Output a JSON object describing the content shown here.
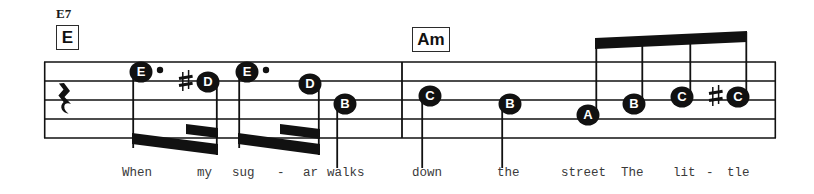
{
  "page": {
    "background": "#ffffff",
    "ink": "#111111",
    "width": 814,
    "height": 194
  },
  "chords": [
    {
      "name": "chord-e7",
      "text": "E7",
      "x": 56,
      "y": 8,
      "type": "symbol"
    },
    {
      "name": "chord-box-e",
      "text": "E",
      "x": 56,
      "y": 26,
      "w": 22,
      "h": 24,
      "type": "box"
    },
    {
      "name": "chord-box-am",
      "text": "Am",
      "x": 412,
      "y": 28,
      "w": 36,
      "h": 24,
      "type": "box"
    }
  ],
  "staff": {
    "left": 44,
    "right": 776,
    "top": 62,
    "line_gap": 19,
    "line_count": 5,
    "barlines": [
      402
    ],
    "rest": {
      "name": "quarter-rest",
      "x": 64,
      "y": 90,
      "label": "quarter-rest"
    }
  },
  "notes": [
    {
      "id": "n1",
      "letter": "E",
      "x": 141,
      "y": 72,
      "accidental": "",
      "dotted": true,
      "stem": "down",
      "lyric": "When"
    },
    {
      "id": "n2",
      "letter": "D",
      "x": 208,
      "y": 82,
      "accidental": "#",
      "dotted": false,
      "stem": "down",
      "lyric": ""
    },
    {
      "id": "n3",
      "letter": "E",
      "x": 247,
      "y": 72,
      "accidental": "",
      "dotted": true,
      "stem": "down",
      "lyric": "my"
    },
    {
      "id": "n4",
      "letter": "D",
      "x": 310,
      "y": 84,
      "accidental": "",
      "dotted": false,
      "stem": "down",
      "lyric": "sug"
    },
    {
      "id": "n5",
      "letter": "B",
      "x": 345,
      "y": 104,
      "accidental": "",
      "dotted": false,
      "stem": "down",
      "lyric": "ar"
    },
    {
      "id": "n6",
      "letter": "C",
      "x": 430,
      "y": 96,
      "accidental": "",
      "dotted": false,
      "stem": "down",
      "lyric": "down"
    },
    {
      "id": "n7",
      "letter": "B",
      "x": 510,
      "y": 104,
      "accidental": "",
      "dotted": false,
      "stem": "down",
      "lyric": "the"
    },
    {
      "id": "n8",
      "letter": "A",
      "x": 588,
      "y": 115,
      "accidental": "",
      "dotted": false,
      "stem": "up",
      "lyric": "street"
    },
    {
      "id": "n9",
      "letter": "B",
      "x": 634,
      "y": 104,
      "accidental": "",
      "dotted": false,
      "stem": "up",
      "lyric": "The"
    },
    {
      "id": "n10",
      "letter": "C",
      "x": 682,
      "y": 97,
      "accidental": "",
      "dotted": false,
      "stem": "up",
      "lyric": "lit"
    },
    {
      "id": "n11",
      "letter": "C",
      "x": 738,
      "y": 97,
      "accidental": "#",
      "dotted": false,
      "stem": "up",
      "lyric": "tle"
    }
  ],
  "lyrics": [
    {
      "name": "lyric-when",
      "text": "When",
      "x": 122
    },
    {
      "name": "lyric-my",
      "text": "my",
      "x": 197
    },
    {
      "name": "lyric-sug",
      "text": "sug",
      "x": 232
    },
    {
      "name": "lyric-hyphen1",
      "text": "-",
      "x": 277
    },
    {
      "name": "lyric-ar",
      "text": "ar",
      "x": 305
    },
    {
      "name": "lyric-walks",
      "text": "walks",
      "x": 327
    },
    {
      "name": "lyric-down",
      "text": "down",
      "x": 413
    },
    {
      "name": "lyric-the",
      "text": "the",
      "x": 497
    },
    {
      "name": "lyric-street",
      "text": "street",
      "x": 561
    },
    {
      "name": "lyric-The",
      "text": "The",
      "x": 620
    },
    {
      "name": "lyric-lit",
      "text": "lit",
      "x": 672
    },
    {
      "name": "lyric-hyphen2",
      "text": "-",
      "x": 703
    },
    {
      "name": "lyric-tle",
      "text": "tle",
      "x": 724
    }
  ]
}
